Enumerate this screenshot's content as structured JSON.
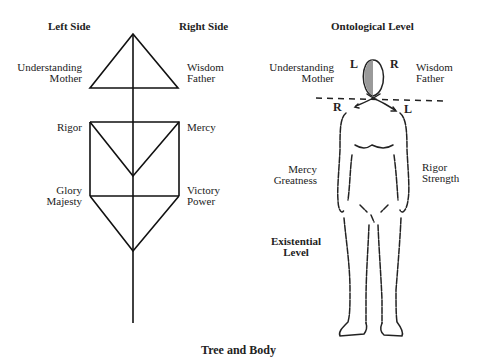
{
  "tree": {
    "left_header": "Left Side",
    "right_header": "Right Side",
    "understanding": [
      "Understanding",
      "Mother"
    ],
    "wisdom": [
      "Wisdom",
      "Father"
    ],
    "rigor": "Rigor",
    "mercy": "Mercy",
    "glory": [
      "Glory",
      "Majesty"
    ],
    "victory": [
      "Victory",
      "Power"
    ]
  },
  "body": {
    "ontological_level": "Ontological Level",
    "understanding": [
      "Understanding",
      "Mother"
    ],
    "wisdom": [
      "Wisdom",
      "Father"
    ],
    "head_left_marker": "L",
    "head_right_marker": "R",
    "shoulder_right_marker": "R",
    "shoulder_left_marker": "L",
    "mercy": [
      "Mercy",
      "Greatness"
    ],
    "rigor": [
      "Rigor",
      "Strength"
    ],
    "existential_level": [
      "Existential",
      "Level"
    ]
  },
  "caption": "Tree and Body"
}
